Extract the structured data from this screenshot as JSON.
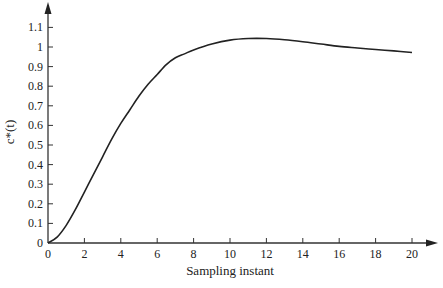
{
  "chart_data": {
    "type": "line",
    "title": "",
    "xlabel": "Sampling instant",
    "ylabel": "c*(t)",
    "xlim": [
      0,
      20
    ],
    "ylim": [
      0,
      1.1
    ],
    "grid": false,
    "legend": null,
    "x_ticks": [
      0,
      2,
      4,
      6,
      8,
      10,
      12,
      14,
      16,
      18,
      20
    ],
    "y_ticks": [
      0,
      0.1,
      0.2,
      0.3,
      0.4,
      0.5,
      0.6,
      0.7,
      0.8,
      0.9,
      1,
      1.1
    ],
    "x_tick_labels": [
      "0",
      "2",
      "4",
      "6",
      "8",
      "10",
      "12",
      "14",
      "16",
      "18",
      "20"
    ],
    "y_tick_labels": [
      "0",
      "0.1",
      "0.2",
      "0.3",
      "0.4",
      "0.5",
      "0.6",
      "0.7",
      "0.8",
      "0.9",
      "1",
      "1.1"
    ],
    "series": [
      {
        "name": "c*(t)",
        "x": [
          0,
          0.5,
          1,
          1.5,
          2,
          2.5,
          3,
          3.5,
          4,
          4.5,
          5,
          5.5,
          6,
          6.5,
          7,
          7.5,
          8,
          9,
          10,
          11,
          12,
          13,
          14,
          15,
          16,
          17,
          18,
          19,
          20
        ],
        "values": [
          0,
          0.03,
          0.09,
          0.17,
          0.26,
          0.35,
          0.44,
          0.53,
          0.61,
          0.68,
          0.75,
          0.81,
          0.86,
          0.91,
          0.945,
          0.965,
          0.985,
          1.015,
          1.035,
          1.043,
          1.043,
          1.037,
          1.027,
          1.015,
          1.003,
          0.995,
          0.987,
          0.98,
          0.972
        ]
      }
    ]
  }
}
